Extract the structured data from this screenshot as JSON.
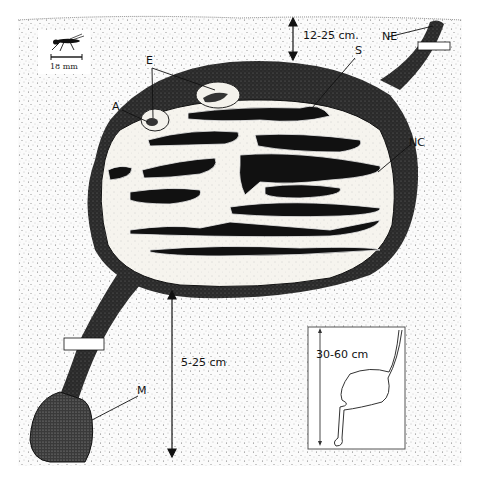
{
  "diagram": {
    "scale_bar": {
      "label": "18 mm"
    },
    "labels": {
      "E": "E",
      "A": "A",
      "S": "S",
      "NE": "NE",
      "NC": "NC",
      "M": "M"
    },
    "dimensions": {
      "top_depth": "12-25 cm.",
      "bottom_depth": "5-25 cm",
      "inset_depth": "30-60 cm"
    },
    "colors": {
      "soil_dots": "#555555",
      "nest_wall": "#1a1a1a",
      "chamber_fill": "#f7f5ef",
      "gallery": "#111111",
      "background": "#ffffff"
    }
  }
}
